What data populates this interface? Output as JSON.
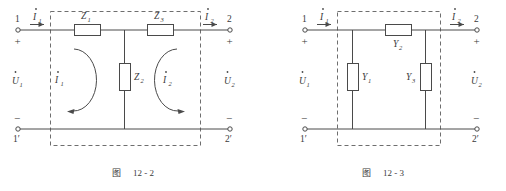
{
  "page": {
    "background_color": "#ffffff",
    "ink_color": "#4a4a4a",
    "dash_color": "#6e6e6e"
  },
  "figures": [
    {
      "id": "figure-12-2",
      "caption_cn": "图",
      "caption_number": "12 - 2",
      "dashed_box_label": "two-port-network-boundary",
      "terminals": [
        {
          "name": "terminal-1",
          "label": "1",
          "polarity": "+"
        },
        {
          "name": "terminal-2",
          "label": "2",
          "polarity": "+"
        },
        {
          "name": "terminal-1-prime",
          "label": "1′",
          "polarity": "−"
        },
        {
          "name": "terminal-2-prime",
          "label": "2′",
          "polarity": "−"
        }
      ],
      "port_voltages": [
        {
          "name": "voltage-u1",
          "symbol": "U",
          "subscript": "1",
          "dotted": true
        },
        {
          "name": "voltage-u2",
          "symbol": "U",
          "subscript": "2",
          "dotted": true
        }
      ],
      "port_currents": [
        {
          "name": "current-i1",
          "symbol": "I",
          "subscript": "1",
          "dotted": true,
          "direction": "right"
        },
        {
          "name": "current-i2",
          "symbol": "I",
          "subscript": "2",
          "dotted": true,
          "direction": "right"
        }
      ],
      "mesh_currents": [
        {
          "name": "mesh-current-i1",
          "symbol": "I",
          "subscript": "1",
          "dotted": true,
          "rotation": "clockwise"
        },
        {
          "name": "mesh-current-i2",
          "symbol": "I",
          "subscript": "2",
          "dotted": true,
          "rotation": "counterclockwise"
        }
      ],
      "components": [
        {
          "name": "impedance-z1",
          "symbol": "Z",
          "subscript": "1",
          "orientation": "horizontal",
          "label_position": "above"
        },
        {
          "name": "impedance-z2",
          "symbol": "Z",
          "subscript": "2",
          "orientation": "vertical",
          "label_position": "right"
        },
        {
          "name": "impedance-z3",
          "symbol": "Z",
          "subscript": "3",
          "orientation": "horizontal",
          "label_position": "above"
        }
      ]
    },
    {
      "id": "figure-12-3",
      "caption_cn": "图",
      "caption_number": "12 - 3",
      "dashed_box_label": "two-port-network-boundary",
      "terminals": [
        {
          "name": "terminal-1",
          "label": "1",
          "polarity": "+"
        },
        {
          "name": "terminal-2",
          "label": "2",
          "polarity": "+"
        },
        {
          "name": "terminal-1-prime",
          "label": "1′",
          "polarity": "−"
        },
        {
          "name": "terminal-2-prime",
          "label": "2′",
          "polarity": "−"
        }
      ],
      "port_voltages": [
        {
          "name": "voltage-u1",
          "symbol": "U",
          "subscript": "1",
          "dotted": true
        },
        {
          "name": "voltage-u2",
          "symbol": "U",
          "subscript": "2",
          "dotted": true
        }
      ],
      "port_currents": [
        {
          "name": "current-i1",
          "symbol": "I",
          "subscript": "1",
          "dotted": true,
          "direction": "right"
        },
        {
          "name": "current-i2",
          "symbol": "I",
          "subscript": "2",
          "dotted": true,
          "direction": "right"
        }
      ],
      "components": [
        {
          "name": "admittance-y1",
          "symbol": "Y",
          "subscript": "1",
          "orientation": "vertical",
          "label_position": "right"
        },
        {
          "name": "admittance-y2",
          "symbol": "Y",
          "subscript": "2",
          "orientation": "horizontal",
          "label_position": "below"
        },
        {
          "name": "admittance-y3",
          "symbol": "Y",
          "subscript": "3",
          "orientation": "vertical",
          "label_position": "left"
        }
      ]
    }
  ],
  "text": {
    "t1": "1",
    "t2": "2",
    "t1p": "1′",
    "t2p": "2′",
    "plus": "+",
    "minus": "−",
    "U": "U",
    "I": "I",
    "Z": "Z",
    "Y": "Y",
    "s1": "1",
    "s2": "2",
    "s3": "3",
    "fig_cn": "图",
    "fig_122": "12 - 2",
    "fig_123": "12 - 3"
  }
}
